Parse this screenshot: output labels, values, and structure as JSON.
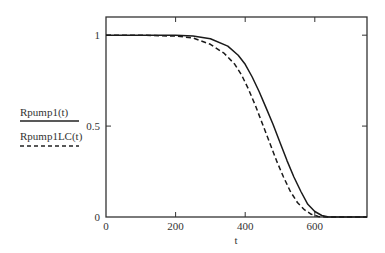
{
  "chart_data": {
    "type": "line",
    "title": "",
    "xlabel": "t",
    "ylabel": "",
    "xlim": [
      0,
      750
    ],
    "ylim": [
      0,
      1.1
    ],
    "grid": false,
    "legend_position": "left",
    "x_ticks": [
      0,
      200,
      400,
      600
    ],
    "x_tick_labels": [
      "0",
      "200",
      "400",
      "600"
    ],
    "y_ticks": [
      0,
      0.5,
      1
    ],
    "y_tick_labels": [
      "0",
      "0.5",
      "1"
    ],
    "series": [
      {
        "name": "Rpump1(t)",
        "style": "solid",
        "x": [
          0,
          100,
          200,
          250,
          300,
          350,
          380,
          400,
          420,
          440,
          460,
          480,
          500,
          520,
          540,
          560,
          580,
          600,
          620,
          640,
          660,
          700,
          750
        ],
        "y": [
          1.0,
          1.0,
          1.0,
          0.995,
          0.98,
          0.94,
          0.89,
          0.84,
          0.77,
          0.69,
          0.6,
          0.51,
          0.41,
          0.31,
          0.22,
          0.14,
          0.07,
          0.03,
          0.008,
          0.0,
          0.0,
          0.0,
          0.0
        ]
      },
      {
        "name": "Rpump1LC(t)",
        "style": "dashed",
        "x": [
          0,
          100,
          200,
          250,
          300,
          340,
          370,
          390,
          410,
          430,
          450,
          470,
          490,
          510,
          530,
          550,
          570,
          590,
          610,
          630,
          660,
          700,
          750
        ],
        "y": [
          1.0,
          1.0,
          0.995,
          0.985,
          0.95,
          0.9,
          0.84,
          0.78,
          0.7,
          0.61,
          0.51,
          0.41,
          0.31,
          0.22,
          0.14,
          0.08,
          0.04,
          0.015,
          0.003,
          0.0,
          0.0,
          0.0,
          0.0
        ]
      }
    ]
  }
}
